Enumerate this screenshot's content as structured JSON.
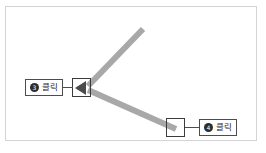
{
  "figure": {
    "title": "",
    "background_color": "#ffffff",
    "frame_color": "#d2d4d8",
    "stroke_color": "#a8a8a8",
    "box_color": "#3b3b3b",
    "cursor_color": "#4a4a4a"
  },
  "callouts": [
    {
      "id": "callout-left",
      "badge": "3",
      "label": "클릭",
      "attached_to": "vertex-box"
    },
    {
      "id": "callout-right",
      "badge": "4",
      "label": "클릭",
      "attached_to": "endpoint-box"
    }
  ],
  "shapes": {
    "upper_segment": {
      "name": "upper-line-segment",
      "from": [
        88,
        86
      ],
      "to": [
        143,
        29
      ],
      "color": "#a8a8a8",
      "width": 6
    },
    "lower_segment": {
      "name": "lower-line-segment",
      "from": [
        88,
        90
      ],
      "to": [
        176,
        129
      ],
      "color": "#a8a8a8",
      "width": 6
    },
    "vertex_box": {
      "name": "vertex-handle-box",
      "x": 72,
      "y": 78,
      "w": 19,
      "h": 19
    },
    "endpoint_box": {
      "name": "endpoint-handle-box",
      "x": 166,
      "y": 118,
      "w": 19,
      "h": 19
    },
    "cursor": {
      "name": "cursor-arrowhead",
      "direction": "left"
    }
  }
}
